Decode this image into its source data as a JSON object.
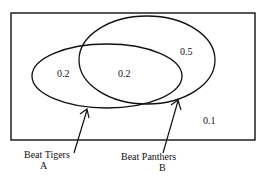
{
  "diagram": {
    "type": "venn",
    "regions": {
      "a_only": "0.2",
      "a_and_b": "0.2",
      "b_only": "0.5",
      "neither": "0.1"
    },
    "sets": [
      {
        "id": "A",
        "name": "Beat Tigers",
        "letter": "A"
      },
      {
        "id": "B",
        "name": "Beat Panthers",
        "letter": "B"
      }
    ]
  }
}
